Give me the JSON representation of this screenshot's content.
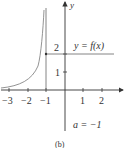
{
  "diagram": {
    "axis_x_label": "x",
    "axis_y_label": "y",
    "x_ticks": [
      {
        "value": -3,
        "label": "−3"
      },
      {
        "value": -2,
        "label": "−2"
      },
      {
        "value": -1,
        "label": "−1"
      },
      {
        "value": 1,
        "label": "1"
      },
      {
        "value": 2,
        "label": "2"
      }
    ],
    "y_ticks": [
      {
        "value": 1,
        "label": "1"
      },
      {
        "value": 2,
        "label": "2"
      }
    ],
    "function_label": "y = f(x)",
    "annotation": "a = −1",
    "caption": "(b)",
    "colors": {
      "axis": "#333333",
      "curve": "#666666"
    }
  }
}
